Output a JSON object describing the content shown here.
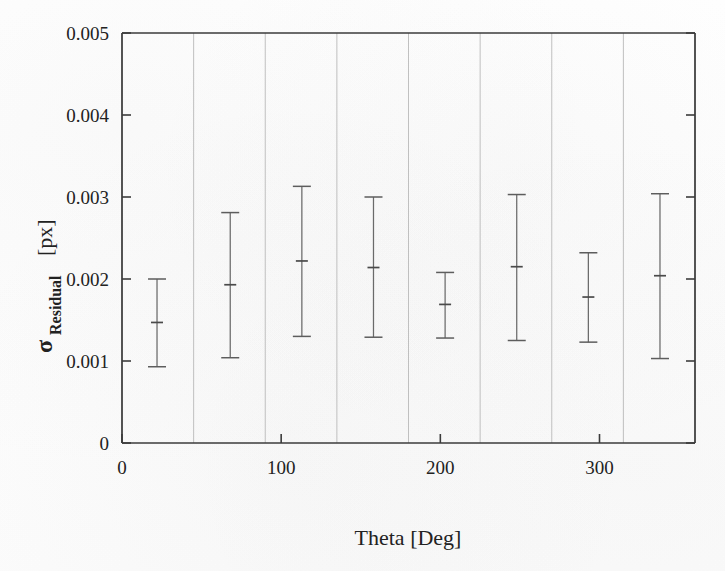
{
  "figure": {
    "kind": "error-bar-plot",
    "background_color": "#ffffff",
    "line_color": "#3b3b3b",
    "grid_color": "#b9b9b9",
    "marker_color": "#5d5d5d"
  },
  "axes": {
    "x": {
      "label": "Theta [Deg]",
      "label_name": "Theta",
      "label_unit": "[Deg]",
      "ticks": [
        "0",
        "100",
        "200",
        "300"
      ],
      "tick_values": [
        0,
        100,
        200,
        300
      ],
      "range": [
        0,
        360
      ],
      "origin_label": "0"
    },
    "y": {
      "label_symbol": "σ",
      "label_subscript": "Residual",
      "label_unit": "[px]",
      "label": "σResidual [px]",
      "ticks": [
        "0",
        "0.001",
        "0.002",
        "0.003",
        "0.004",
        "0.005"
      ],
      "tick_values": [
        0,
        0.001,
        0.002,
        0.003,
        0.004,
        0.005
      ],
      "range": [
        0,
        0.005
      ],
      "origin_label": "0"
    }
  },
  "chart_data": {
    "type": "scatter",
    "title": "",
    "subtitle": "",
    "xlabel": "Theta [Deg]",
    "ylabel": "σResidual [px]",
    "xlim": [
      0,
      360
    ],
    "ylim": [
      0,
      0.005
    ],
    "xticks": [
      0,
      100,
      200,
      300
    ],
    "yticks": [
      0,
      0.001,
      0.002,
      0.003,
      0.004,
      0.005
    ],
    "grid": "vertical-only",
    "gridline_x": [
      0,
      45,
      90,
      135,
      180,
      225,
      270,
      315,
      360
    ],
    "legend": null,
    "legend_position": "none",
    "error_bar_style": "capped-vertical-with-center-tick",
    "x": [
      22,
      68,
      113,
      158,
      203,
      248,
      293,
      338
    ],
    "y": [
      0.00147,
      0.00193,
      0.00222,
      0.00214,
      0.00169,
      0.00215,
      0.00178,
      0.00204
    ],
    "y_upper": [
      0.002,
      0.00281,
      0.00313,
      0.003,
      0.00208,
      0.00303,
      0.00232,
      0.00304
    ],
    "y_lower": [
      0.00093,
      0.00104,
      0.0013,
      0.00129,
      0.00128,
      0.00125,
      0.00123,
      0.00103
    ],
    "series": [
      {
        "name": "Residual sigma",
        "points": [
          {
            "x": 22,
            "y": 0.00147,
            "lo": 0.00093,
            "hi": 0.002
          },
          {
            "x": 68,
            "y": 0.00193,
            "lo": 0.00104,
            "hi": 0.00281
          },
          {
            "x": 113,
            "y": 0.00222,
            "lo": 0.0013,
            "hi": 0.00313
          },
          {
            "x": 158,
            "y": 0.00214,
            "lo": 0.00129,
            "hi": 0.003
          },
          {
            "x": 203,
            "y": 0.00169,
            "lo": 0.00128,
            "hi": 0.00208
          },
          {
            "x": 248,
            "y": 0.00215,
            "lo": 0.00125,
            "hi": 0.00303
          },
          {
            "x": 293,
            "y": 0.00178,
            "lo": 0.00123,
            "hi": 0.00232
          },
          {
            "x": 338,
            "y": 0.00204,
            "lo": 0.00103,
            "hi": 0.00304
          }
        ]
      }
    ]
  }
}
